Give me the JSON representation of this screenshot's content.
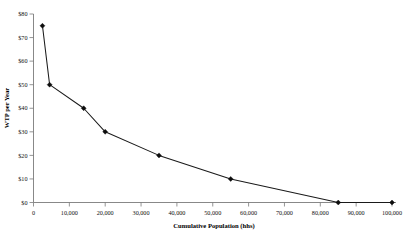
{
  "chart_data": {
    "type": "line",
    "title": "",
    "subtitle": "",
    "xlabel": "Cumulative Population (hhs)",
    "ylabel": "WTP per Year",
    "xlim": [
      0,
      100000
    ],
    "ylim": [
      0,
      80
    ],
    "grid": false,
    "legend": false,
    "legend_position": "none",
    "marker": "diamond",
    "x_tick_labels": [
      "0",
      "10,000",
      "20,000",
      "30,000",
      "40,000",
      "50,000",
      "60,000",
      "70,000",
      "80,000",
      "90,000",
      "100,000"
    ],
    "x_tick_values": [
      0,
      10000,
      20000,
      30000,
      40000,
      50000,
      60000,
      70000,
      80000,
      90000,
      100000
    ],
    "y_tick_labels": [
      "$0",
      "$10",
      "$20",
      "$30",
      "$40",
      "$50",
      "$60",
      "$70",
      "$80"
    ],
    "y_tick_values": [
      0,
      10,
      20,
      30,
      40,
      50,
      60,
      70,
      80
    ],
    "series": [
      {
        "name": "WTP per Year",
        "color": "#0d0d0d",
        "x": [
          2500,
          4500,
          14000,
          20000,
          35000,
          55000,
          85000,
          100000
        ],
        "y": [
          75,
          50,
          40,
          30,
          20,
          10,
          0,
          0
        ]
      }
    ]
  },
  "axes": {
    "x_title": "Cumulative Population (hhs)",
    "y_title": "WTP per Year"
  }
}
